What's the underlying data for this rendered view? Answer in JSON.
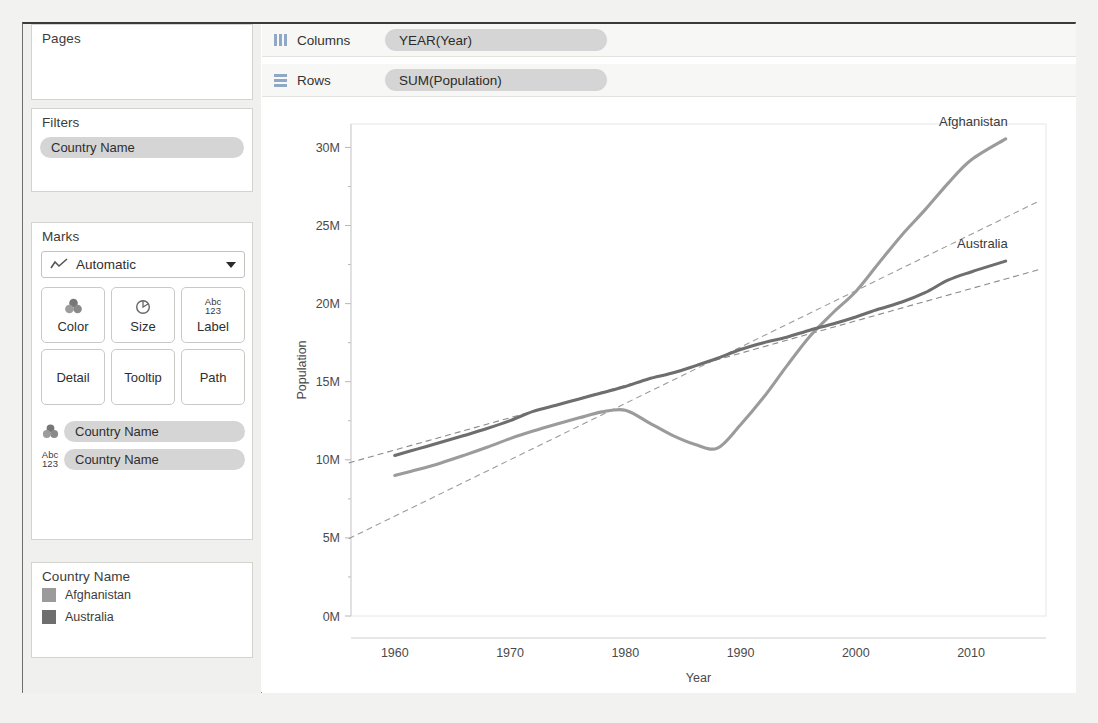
{
  "sidebar": {
    "pages": {
      "title": "Pages"
    },
    "filters": {
      "title": "Filters",
      "pills": [
        "Country Name"
      ]
    },
    "marks": {
      "title": "Marks",
      "type_selected": "Automatic",
      "buttons": [
        {
          "label": "Color",
          "icon": "color-palette-icon"
        },
        {
          "label": "Size",
          "icon": "size-circle-icon"
        },
        {
          "label": "Label",
          "icon": "abc-123-icon",
          "icon_text_top": "Abc",
          "icon_text_bottom": "123"
        },
        {
          "label": "Detail",
          "icon": ""
        },
        {
          "label": "Tooltip",
          "icon": ""
        },
        {
          "label": "Path",
          "icon": ""
        }
      ],
      "encodings": [
        {
          "icon": "color-palette-icon",
          "label": "Country Name"
        },
        {
          "icon": "abc-123-icon",
          "label": "Country Name",
          "icon_text_top": "Abc",
          "icon_text_bottom": "123"
        }
      ]
    },
    "legend": {
      "title": "Country Name",
      "items": [
        {
          "label": "Afghanistan",
          "color": "#9b9b9b"
        },
        {
          "label": "Australia",
          "color": "#6e6e6e"
        }
      ]
    }
  },
  "shelves": [
    {
      "name": "Columns",
      "icon": "columns-icon",
      "pill": "YEAR(Year)"
    },
    {
      "name": "Rows",
      "icon": "rows-icon",
      "pill": "SUM(Population)"
    }
  ],
  "chart_data": {
    "type": "line",
    "title": "",
    "xlabel": "Year",
    "ylabel": "Population",
    "xlim": [
      1956,
      1916
    ],
    "xticks": [
      1960,
      1970,
      1980,
      1990,
      2000,
      2010
    ],
    "yticks": [
      0,
      5000000,
      10000000,
      15000000,
      20000000,
      25000000,
      30000000
    ],
    "ytick_labels": [
      "0M",
      "5M",
      "10M",
      "15M",
      "20M",
      "25M",
      "30M"
    ],
    "ylim": [
      0,
      31500000
    ],
    "grid": false,
    "legend_position": "right-labels",
    "annotations": [
      {
        "text": "Afghanistan",
        "series": "Afghanistan",
        "at_x": 2013
      },
      {
        "text": "Australia",
        "series": "Australia",
        "at_x": 2013
      }
    ],
    "series": [
      {
        "name": "Afghanistan",
        "color": "#9b9b9b",
        "style": "solid",
        "x": [
          1960,
          1962,
          1964,
          1966,
          1968,
          1970,
          1972,
          1974,
          1976,
          1978,
          1980,
          1982,
          1984,
          1986,
          1988,
          1990,
          1992,
          1994,
          1996,
          1998,
          2000,
          2002,
          2004,
          2006,
          2008,
          2010,
          2013
        ],
        "values": [
          8996973,
          9380000,
          9799000,
          10283000,
          10799000,
          11355000,
          11840000,
          12277000,
          12687000,
          13068000,
          13180000,
          12400000,
          11600000,
          11000000,
          10750000,
          12249000,
          14000000,
          16000000,
          17900000,
          19400000,
          20780000,
          22600000,
          24400000,
          26000000,
          27700000,
          29200000,
          30552000
        ]
      },
      {
        "name": "Australia",
        "color": "#6e6e6e",
        "style": "solid",
        "x": [
          1960,
          1962,
          1964,
          1966,
          1968,
          1970,
          1972,
          1974,
          1976,
          1978,
          1980,
          1982,
          1984,
          1986,
          1988,
          1990,
          1992,
          1994,
          1996,
          1998,
          2000,
          2002,
          2004,
          2006,
          2008,
          2010,
          2013
        ],
        "values": [
          10276477,
          10700000,
          11120000,
          11550000,
          12000000,
          12507000,
          13100000,
          13500000,
          13900000,
          14300000,
          14700000,
          15180000,
          15540000,
          16000000,
          16500000,
          17065000,
          17500000,
          17850000,
          18300000,
          18700000,
          19150000,
          19650000,
          20100000,
          20700000,
          21500000,
          22030000,
          22720000
        ]
      },
      {
        "name": "Afghanistan trend",
        "color": "#9b9b9b",
        "style": "dashed",
        "x": [
          1956,
          2016
        ],
        "values": [
          4950000,
          26600000
        ]
      },
      {
        "name": "Australia trend",
        "color": "#8a8a8a",
        "style": "dashed",
        "x": [
          1956,
          2016
        ],
        "values": [
          9800000,
          22200000
        ]
      }
    ]
  }
}
